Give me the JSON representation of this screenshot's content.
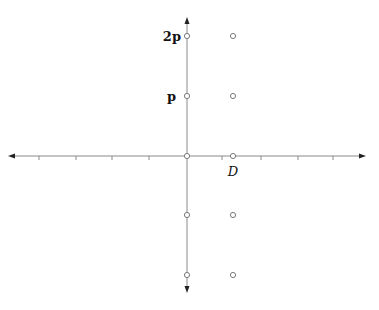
{
  "diagram": {
    "type": "lattice-points-on-axes",
    "colors": {
      "axis": "#8a8a8a",
      "point": "#7a7a7a",
      "text": "#111111",
      "background": "#ffffff"
    },
    "axes": {
      "origin": [
        187,
        156
      ],
      "x_range_px": [
        8,
        366
      ],
      "y_range_px": [
        17,
        293
      ],
      "x_ticks_px": [
        39,
        76,
        112,
        149,
        222,
        261,
        298,
        333
      ]
    },
    "labels": {
      "two_p": "2p",
      "p": "p",
      "d": "D"
    },
    "points": [
      {
        "x": 187,
        "y": 36
      },
      {
        "x": 233,
        "y": 36
      },
      {
        "x": 187,
        "y": 96
      },
      {
        "x": 233,
        "y": 96
      },
      {
        "x": 187,
        "y": 156
      },
      {
        "x": 233,
        "y": 156
      },
      {
        "x": 187,
        "y": 215
      },
      {
        "x": 233,
        "y": 215
      },
      {
        "x": 187,
        "y": 275
      },
      {
        "x": 233,
        "y": 275
      }
    ]
  }
}
